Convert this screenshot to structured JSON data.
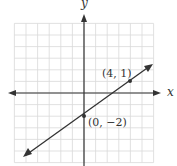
{
  "chart_data": {
    "type": "line",
    "title": "",
    "xlabel": "x",
    "ylabel": "y",
    "xlim": [
      -6,
      6
    ],
    "ylim": [
      -6,
      6
    ],
    "grid": true,
    "series": [
      {
        "name": "line",
        "x": [
          -6,
          6
        ],
        "y": [
          -6.5,
          2.5
        ],
        "equation": "y = 0.75x - 2"
      }
    ],
    "points": [
      {
        "x": 0,
        "y": -2,
        "label": "(0, −2)"
      },
      {
        "x": 4,
        "y": 1,
        "label": "(4, 1)"
      }
    ],
    "annotations": [
      "(4, 1)",
      "(0, −2)"
    ]
  },
  "labels": {
    "x_axis": "x",
    "y_axis": "y",
    "point_a": "(4, 1)",
    "point_b": "(0, −2)"
  },
  "colors": {
    "grid": "#d9d9d9",
    "axis": "#333333",
    "line": "#333333"
  }
}
